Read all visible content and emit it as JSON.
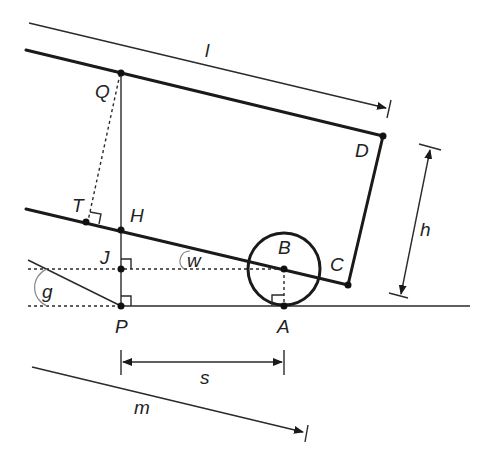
{
  "figure": {
    "type": "geometry-diagram"
  },
  "points": {
    "Q": "Q",
    "D": "D",
    "C": "C",
    "T": "T",
    "H": "H",
    "J": "J",
    "B": "B",
    "P": "P",
    "A": "A"
  },
  "dimensions": {
    "l": "l",
    "h": "h",
    "s": "s",
    "m": "m"
  },
  "angles": {
    "w": "w",
    "g": "g"
  },
  "colors": {
    "stroke": "#1a1a1a",
    "angle_arc": "#888888",
    "background": "#ffffff"
  }
}
